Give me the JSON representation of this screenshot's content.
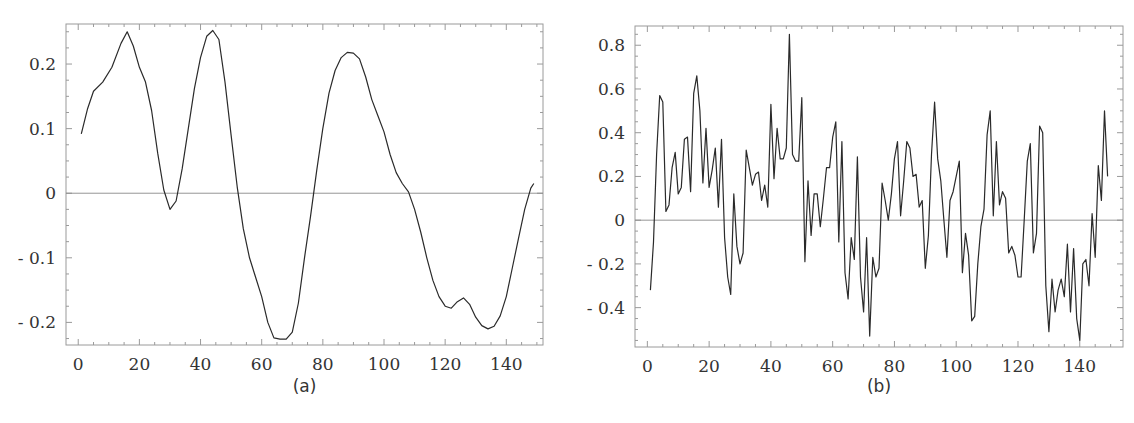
{
  "chart_data": [
    {
      "id": "a",
      "type": "line",
      "title": "",
      "caption": "(a)",
      "xlabel": "",
      "ylabel": "",
      "xlim": [
        -4,
        152
      ],
      "ylim": [
        -0.235,
        0.262
      ],
      "xticks": [
        0,
        20,
        40,
        60,
        80,
        100,
        120,
        140
      ],
      "yticks": [
        -0.2,
        -0.1,
        0,
        0.1,
        0.2
      ],
      "ytick_labels": [
        "- 0.2",
        "- 0.1",
        "0",
        "0.1",
        "0.2"
      ],
      "zero_line": true,
      "grid": false,
      "x": [
        1,
        3,
        5,
        8,
        11,
        14,
        16,
        18,
        20,
        22,
        24,
        26,
        28,
        30,
        32,
        34,
        36,
        38,
        40,
        42,
        44,
        46,
        48,
        50,
        52,
        54,
        56,
        58,
        60,
        62,
        64,
        66,
        68,
        70,
        72,
        74,
        76,
        78,
        80,
        82,
        84,
        86,
        88,
        90,
        92,
        94,
        96,
        98,
        100,
        102,
        104,
        106,
        108,
        110,
        112,
        114,
        116,
        118,
        120,
        122,
        124,
        126,
        128,
        130,
        132,
        134,
        136,
        138,
        140,
        142,
        144,
        146,
        148,
        149
      ],
      "values": [
        0.092,
        0.13,
        0.158,
        0.172,
        0.195,
        0.232,
        0.25,
        0.228,
        0.195,
        0.172,
        0.128,
        0.062,
        0.005,
        -0.025,
        -0.012,
        0.038,
        0.1,
        0.162,
        0.21,
        0.243,
        0.252,
        0.238,
        0.172,
        0.09,
        0.01,
        -0.055,
        -0.1,
        -0.13,
        -0.16,
        -0.2,
        -0.224,
        -0.226,
        -0.226,
        -0.215,
        -0.17,
        -0.1,
        -0.035,
        0.035,
        0.1,
        0.155,
        0.19,
        0.21,
        0.218,
        0.217,
        0.208,
        0.18,
        0.145,
        0.12,
        0.095,
        0.06,
        0.032,
        0.015,
        0.002,
        -0.025,
        -0.06,
        -0.1,
        -0.135,
        -0.16,
        -0.175,
        -0.178,
        -0.168,
        -0.162,
        -0.172,
        -0.192,
        -0.205,
        -0.21,
        -0.206,
        -0.19,
        -0.16,
        -0.115,
        -0.07,
        -0.025,
        0.008,
        0.015
      ]
    },
    {
      "id": "b",
      "type": "line",
      "title": "",
      "caption": "(b)",
      "xlabel": "",
      "ylabel": "",
      "xlim": [
        -4,
        154
      ],
      "ylim": [
        -0.58,
        0.888
      ],
      "xticks": [
        0,
        20,
        40,
        60,
        80,
        100,
        120,
        140
      ],
      "yticks": [
        -0.4,
        -0.2,
        0,
        0.2,
        0.4,
        0.6,
        0.8
      ],
      "ytick_labels": [
        "- 0.4",
        "- 0.2",
        "0",
        "0.2",
        "0.4",
        "0.6",
        "0.8"
      ],
      "zero_line": true,
      "grid": false,
      "x": [
        1,
        2,
        3,
        4,
        5,
        6,
        7,
        8,
        9,
        10,
        11,
        12,
        13,
        14,
        15,
        16,
        17,
        18,
        19,
        20,
        21,
        22,
        23,
        24,
        25,
        26,
        27,
        28,
        29,
        30,
        31,
        32,
        33,
        34,
        35,
        36,
        37,
        38,
        39,
        40,
        41,
        42,
        43,
        44,
        45,
        46,
        47,
        48,
        49,
        50,
        51,
        52,
        53,
        54,
        55,
        56,
        57,
        58,
        59,
        60,
        61,
        62,
        63,
        64,
        65,
        66,
        67,
        68,
        69,
        70,
        71,
        72,
        73,
        74,
        75,
        76,
        77,
        78,
        79,
        80,
        81,
        82,
        83,
        84,
        85,
        86,
        87,
        88,
        89,
        90,
        91,
        92,
        93,
        94,
        95,
        96,
        97,
        98,
        99,
        100,
        101,
        102,
        103,
        104,
        105,
        106,
        107,
        108,
        109,
        110,
        111,
        112,
        113,
        114,
        115,
        116,
        117,
        118,
        119,
        120,
        121,
        122,
        123,
        124,
        125,
        126,
        127,
        128,
        129,
        130,
        131,
        132,
        133,
        134,
        135,
        136,
        137,
        138,
        139,
        140,
        141,
        142,
        143,
        144,
        145,
        146,
        147,
        148,
        149
      ],
      "values": [
        -0.32,
        -0.1,
        0.3,
        0.57,
        0.54,
        0.04,
        0.07,
        0.24,
        0.31,
        0.12,
        0.15,
        0.37,
        0.38,
        0.13,
        0.58,
        0.66,
        0.5,
        0.17,
        0.42,
        0.15,
        0.23,
        0.33,
        0.06,
        0.37,
        -0.08,
        -0.26,
        -0.34,
        0.12,
        -0.12,
        -0.2,
        -0.15,
        0.32,
        0.24,
        0.16,
        0.21,
        0.22,
        0.09,
        0.16,
        0.06,
        0.53,
        0.19,
        0.42,
        0.28,
        0.28,
        0.33,
        0.85,
        0.3,
        0.27,
        0.27,
        0.56,
        -0.19,
        0.18,
        -0.07,
        0.12,
        0.12,
        -0.03,
        0.1,
        0.24,
        0.24,
        0.38,
        0.45,
        -0.1,
        0.36,
        -0.24,
        -0.36,
        -0.08,
        -0.18,
        0.29,
        -0.26,
        -0.42,
        -0.08,
        -0.53,
        -0.17,
        -0.26,
        -0.22,
        0.17,
        0.09,
        0.0,
        0.12,
        0.28,
        0.36,
        0.02,
        0.18,
        0.36,
        0.33,
        0.2,
        0.21,
        0.06,
        0.09,
        -0.22,
        -0.07,
        0.3,
        0.54,
        0.28,
        0.18,
        0.0,
        -0.17,
        0.09,
        0.13,
        0.2,
        0.27,
        -0.24,
        -0.06,
        -0.16,
        -0.46,
        -0.44,
        -0.2,
        -0.03,
        0.05,
        0.39,
        0.5,
        0.02,
        0.36,
        0.07,
        0.13,
        0.1,
        -0.15,
        -0.12,
        -0.16,
        -0.26,
        -0.26,
        0.0,
        0.27,
        0.35,
        -0.15,
        -0.06,
        0.43,
        0.4,
        -0.3,
        -0.51,
        -0.27,
        -0.42,
        -0.32,
        -0.27,
        -0.35,
        -0.11,
        -0.42,
        -0.13,
        -0.45,
        -0.55,
        -0.2,
        -0.18,
        -0.3,
        0.03,
        -0.17,
        0.25,
        0.09,
        0.5,
        0.2,
        0.15
      ]
    }
  ]
}
